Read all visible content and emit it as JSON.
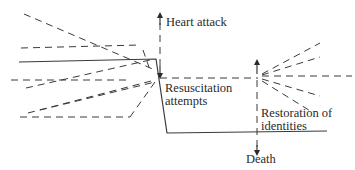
{
  "diagram": {
    "colors": {
      "line": "#3a3a3a",
      "text": "#2a2a2a",
      "background": "#ffffff"
    },
    "labels": {
      "heart_attack": "Heart attack",
      "resuscitation_line1": "Resuscitation",
      "resuscitation_line2": "attempts",
      "restoration_line1": "Restoration of",
      "restoration_line2": "identities",
      "death": "Death"
    },
    "solid_trajectory": [
      [
        19,
        62
      ],
      [
        156,
        59
      ],
      [
        167,
        133
      ],
      [
        327,
        131
      ]
    ],
    "left_fan_focus": [
      157,
      78
    ],
    "left_fan_dashes": [
      [
        [
          24,
          14
        ],
        [
          155,
          70
        ]
      ],
      [
        [
          21,
          48
        ],
        [
          140,
          45
        ]
      ],
      [
        [
          11,
          80
        ],
        [
          130,
          80
        ]
      ],
      [
        [
          26,
          88
        ],
        [
          150,
          60
        ]
      ],
      [
        [
          20,
          117
        ],
        [
          130,
          117
        ]
      ],
      [
        [
          28,
          113
        ],
        [
          155,
          80
        ]
      ],
      [
        [
          40,
          110
        ],
        [
          155,
          82
        ]
      ],
      [
        [
          130,
          117
        ],
        [
          155,
          82
        ]
      ],
      [
        [
          143,
          50
        ],
        [
          150,
          70
        ]
      ]
    ],
    "right_fan_focus": [
      259,
      76
    ],
    "right_fan_dashes": [
      [
        [
          262,
          74
        ],
        [
          320,
          43
        ]
      ],
      [
        [
          262,
          75
        ],
        [
          320,
          57
        ]
      ],
      [
        [
          262,
          76
        ],
        [
          352,
          76
        ]
      ],
      [
        [
          262,
          79
        ],
        [
          320,
          96
        ]
      ],
      [
        [
          262,
          81
        ],
        [
          312,
          112
        ]
      ]
    ],
    "heart_attack_axis": {
      "x": 160,
      "y_top": 15,
      "y_bottom": 76
    },
    "baseline_dashed": {
      "y": 78,
      "x_start": 160,
      "x_end": 258
    },
    "death_axis": {
      "x": 257,
      "y_top": 62,
      "y_bottom": 157
    }
  }
}
